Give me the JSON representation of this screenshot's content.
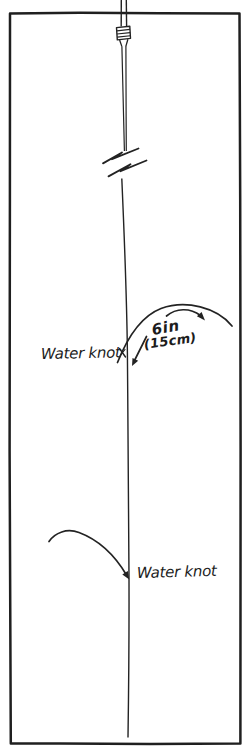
{
  "diagram": {
    "labels": {
      "upper_water_knot": "Water knot",
      "length_inches": "6in",
      "length_cm": "(15cm)",
      "lower_water_knot": "Water knot"
    },
    "icons": {
      "nail_knot": "coiled barrel knot joining fly line to leader",
      "line_break": "double zigzag break marks across the line",
      "dropper_arc_upper": "curved tag line arc with pointer arrows",
      "dropper_arc_lower": "curved tag line arc with arrowhead"
    },
    "colors": {
      "ink": "#232323",
      "frame": "#1f1f1f",
      "paper": "#ffffff"
    }
  }
}
